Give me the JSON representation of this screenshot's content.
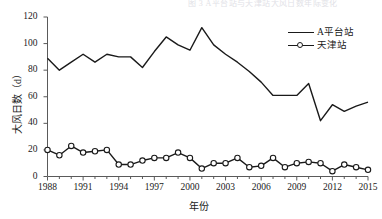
{
  "figure": {
    "top_artifact_text": "图 3 A平台站与天津站大风日数年际变化",
    "background_color": "#ffffff",
    "line_color": "#1a1a1a",
    "axis_color": "#5a5a5a"
  },
  "chart_data": {
    "type": "line",
    "title": "",
    "xlabel": "年份",
    "ylabel": "大风日数（d）",
    "ylim": [
      0,
      120
    ],
    "xlim": [
      1988,
      2015
    ],
    "yticks": [
      0,
      20,
      40,
      60,
      80,
      100,
      120
    ],
    "xticks": [
      1988,
      1991,
      1994,
      1997,
      2000,
      2003,
      2006,
      2009,
      2012,
      2015
    ],
    "grid": false,
    "legend_position": "top-right",
    "x": [
      1988,
      1989,
      1990,
      1991,
      1992,
      1993,
      1994,
      1995,
      1996,
      1997,
      1998,
      1999,
      2000,
      2001,
      2002,
      2003,
      2004,
      2005,
      2006,
      2007,
      2008,
      2009,
      2010,
      2011,
      2012,
      2013,
      2014,
      2015
    ],
    "series": [
      {
        "name": "A平台站",
        "marker": "none",
        "line_style": "solid",
        "color": "#1a1a1a",
        "values": [
          89,
          80,
          86,
          92,
          86,
          92,
          90,
          90,
          82,
          94,
          105,
          99,
          95,
          112,
          99,
          92,
          86,
          79,
          71,
          61,
          61,
          61,
          70,
          42,
          54,
          49,
          53,
          56
        ]
      },
      {
        "name": "天津站",
        "marker": "open-circle",
        "line_style": "solid",
        "color": "#1a1a1a",
        "values": [
          20,
          16,
          23,
          18,
          19,
          20,
          9,
          9,
          12,
          14,
          14,
          18,
          14,
          6,
          10,
          10,
          14,
          7,
          8,
          14,
          7,
          10,
          11,
          10,
          4,
          9,
          7,
          5
        ]
      }
    ],
    "legend": [
      "A平台站",
      "天津站"
    ]
  },
  "axis_labels": {
    "y": [
      "120",
      "100",
      "80",
      "60",
      "40",
      "20",
      "0"
    ],
    "x": [
      "1988",
      "1991",
      "1994",
      "1997",
      "2000",
      "2003",
      "2006",
      "2009",
      "2012",
      "2015"
    ]
  }
}
